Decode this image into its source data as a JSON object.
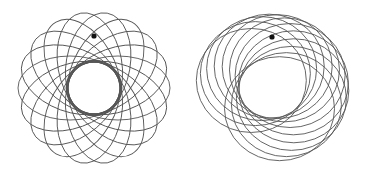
{
  "figures": [
    {
      "name": "precessing-ellipse-rosette",
      "center": [
        94,
        88
      ],
      "semi_major": 52,
      "semi_minor": 32,
      "offset": 24,
      "count": 18,
      "stroke": "#555555",
      "stroke_width": 0.9,
      "dot": [
        94,
        36
      ],
      "dot_color": "#111111",
      "dot_radius": 2.6
    },
    {
      "name": "precessing-offset-circle-rosette",
      "center": [
        272,
        88
      ],
      "radius_x": 55,
      "radius_y": 52,
      "offset": 22,
      "count": 12,
      "start_angle_deg": 200,
      "sweep_deg": 230,
      "stroke": "#555555",
      "stroke_width": 0.9,
      "dot": [
        272,
        37
      ],
      "dot_color": "#111111",
      "dot_radius": 2.6
    }
  ]
}
